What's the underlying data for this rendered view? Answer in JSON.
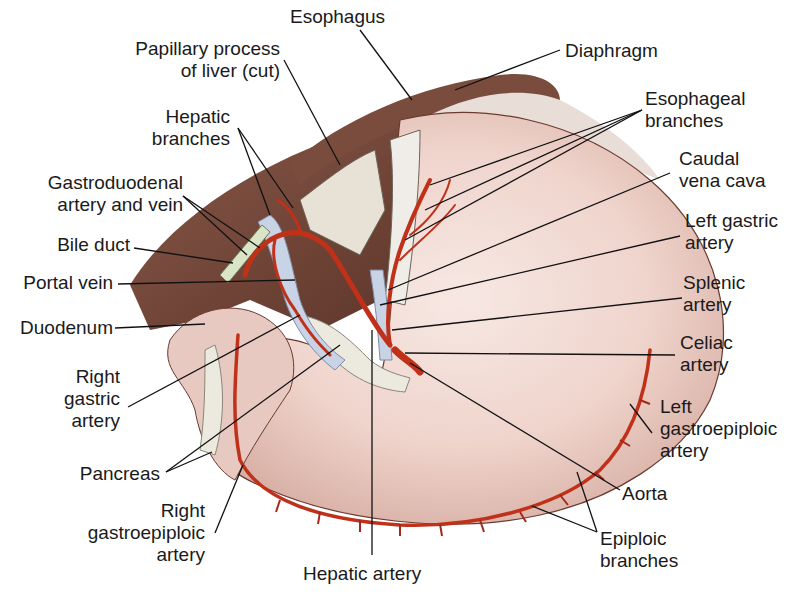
{
  "figure": {
    "colors": {
      "stomach": "#efd6cf",
      "stomach_shadow": "#d9b3a8",
      "liver_dark": "#6b3f32",
      "artery": "#c0311a",
      "vein": "#c9d3e6",
      "pancreas": "#e8e6dc",
      "leader_line": "#111111"
    }
  },
  "labels": {
    "esophagus": {
      "lines": [
        "Esophagus"
      ]
    },
    "papillary_process": {
      "lines": [
        "Papillary process",
        "of liver (cut)"
      ]
    },
    "diaphragm": {
      "lines": [
        "Diaphragm"
      ]
    },
    "hepatic_branches": {
      "lines": [
        "Hepatic",
        "branches"
      ]
    },
    "esophageal_branches": {
      "lines": [
        "Esophageal",
        "branches"
      ]
    },
    "caudal_vena_cava": {
      "lines": [
        "Caudal",
        "vena cava"
      ]
    },
    "gastroduodenal": {
      "lines": [
        "Gastroduodenal",
        "artery and vein"
      ]
    },
    "left_gastric_artery": {
      "lines": [
        "Left gastric",
        "artery"
      ]
    },
    "bile_duct": {
      "lines": [
        "Bile duct"
      ]
    },
    "portal_vein": {
      "lines": [
        "Portal vein"
      ]
    },
    "splenic_artery": {
      "lines": [
        "Splenic",
        "artery"
      ]
    },
    "duodenum": {
      "lines": [
        "Duodenum"
      ]
    },
    "celiac_artery": {
      "lines": [
        "Celiac",
        "artery"
      ]
    },
    "right_gastric_artery": {
      "lines": [
        "Right",
        "gastric",
        "artery"
      ]
    },
    "left_gastroepiploic_artery": {
      "lines": [
        "Left",
        "gastroepiploic",
        "artery"
      ]
    },
    "pancreas": {
      "lines": [
        "Pancreas"
      ]
    },
    "aorta": {
      "lines": [
        "Aorta"
      ]
    },
    "right_gastroepiploic_artery": {
      "lines": [
        "Right",
        "gastroepiploic",
        "artery"
      ]
    },
    "epiploic_branches": {
      "lines": [
        "Epiploic",
        "branches"
      ]
    },
    "hepatic_artery": {
      "lines": [
        "Hepatic artery"
      ]
    }
  }
}
